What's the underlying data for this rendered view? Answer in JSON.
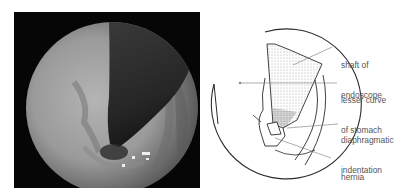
{
  "photo": {
    "description": "endoscopic view (retroflexed) showing endoscope shaft and hiatus hernia",
    "background": "#060606",
    "mucosa_color": "#a8a8a8",
    "shaft_color": "#2a2a2a"
  },
  "diagram": {
    "line_color": "#2b2b2b",
    "leader_color": "#777777",
    "labels": [
      {
        "id": "shaft",
        "line1": "shaft of",
        "line2": "endoscope"
      },
      {
        "id": "lesser-curve",
        "line1": "lesser curve",
        "line2": "of stomach"
      },
      {
        "id": "diaphragmatic",
        "line1": "diaphragmatic",
        "line2": "indentation"
      },
      {
        "id": "hernia",
        "line1": "hernia",
        "line2": ""
      }
    ]
  }
}
